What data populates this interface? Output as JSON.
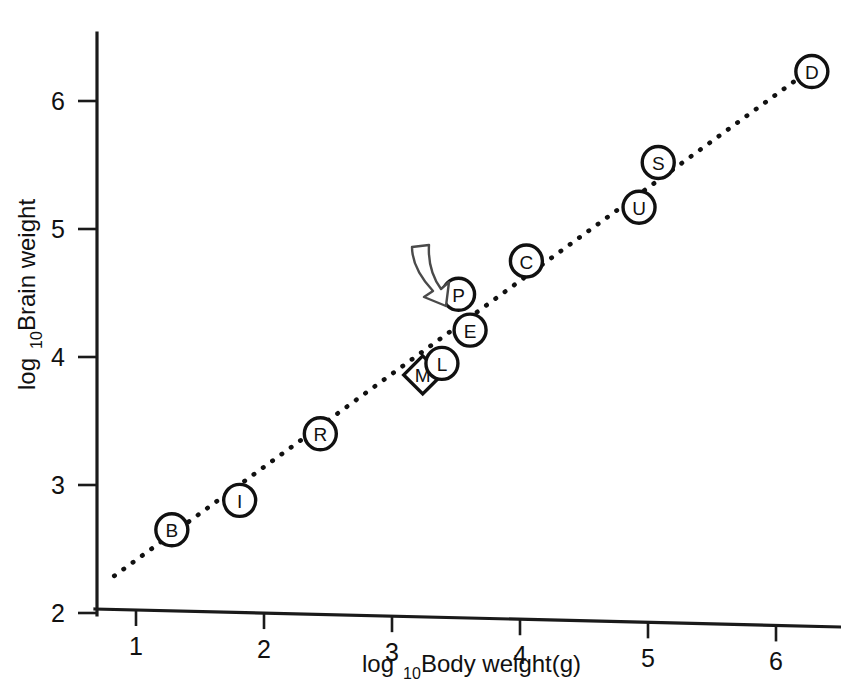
{
  "figure": {
    "background_color": "#ffffff",
    "ink_color": "#111111"
  },
  "axes": {
    "x_title_main": "log",
    "x_title_sub": "10",
    "x_title_rest": " Body weight(g)",
    "y_title_main": "log",
    "y_title_sub": "10",
    "y_title_rest": " Brain weight"
  },
  "annotation": {
    "name": "curved-arrow",
    "target_point": "P",
    "stroke_color": "#4a4a4a"
  },
  "chart_data": {
    "type": "scatter",
    "title": "",
    "xlabel": "log10 Body weight(g)",
    "ylabel": "log10 Brain weight",
    "xlim": [
      0.6,
      6.6
    ],
    "ylim": [
      2.0,
      6.45
    ],
    "xticks": [
      1,
      2,
      3,
      4,
      5,
      6
    ],
    "yticks": [
      2,
      3,
      4,
      5,
      6
    ],
    "xtick_labels": [
      "1",
      "2",
      "3",
      "4",
      "5",
      "6"
    ],
    "ytick_labels": [
      "2",
      "3",
      "4",
      "5",
      "6"
    ],
    "grid": false,
    "legend": "none",
    "points": [
      {
        "label": "B",
        "x": 1.28,
        "y": 2.65,
        "shape": "circle"
      },
      {
        "label": "I",
        "x": 1.81,
        "y": 2.88,
        "shape": "circle"
      },
      {
        "label": "R",
        "x": 2.44,
        "y": 3.4,
        "shape": "circle"
      },
      {
        "label": "M",
        "x": 3.24,
        "y": 3.86,
        "shape": "diamond"
      },
      {
        "label": "L",
        "x": 3.39,
        "y": 3.95,
        "shape": "circle"
      },
      {
        "label": "E",
        "x": 3.61,
        "y": 4.21,
        "shape": "circle"
      },
      {
        "label": "P",
        "x": 3.52,
        "y": 4.49,
        "shape": "circle"
      },
      {
        "label": "C",
        "x": 4.05,
        "y": 4.75,
        "shape": "circle"
      },
      {
        "label": "U",
        "x": 4.93,
        "y": 5.17,
        "shape": "circle"
      },
      {
        "label": "S",
        "x": 5.08,
        "y": 5.52,
        "shape": "circle"
      },
      {
        "label": "D",
        "x": 6.28,
        "y": 6.23,
        "shape": "circle"
      }
    ],
    "fit_line": {
      "style": "dotted",
      "x_start": 0.83,
      "y_start": 2.29,
      "x_end": 6.22,
      "y_end": 6.21
    }
  }
}
